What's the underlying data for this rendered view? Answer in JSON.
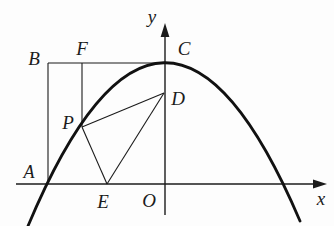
{
  "figure": {
    "background_color": "#fdfdfd",
    "ink_color": "#1b1b1b",
    "labels": {
      "y_axis": "y",
      "x_axis": "x",
      "origin": "O",
      "point_a": "A",
      "point_b": "B",
      "point_c": "C",
      "point_d": "D",
      "point_e": "E",
      "point_f": "F",
      "point_p": "P"
    },
    "geometry": {
      "parabola": {
        "opens": "down",
        "vertex_label": "C",
        "left_x_intercept_label": "A",
        "passes_through": [
          "A",
          "P",
          "C"
        ]
      },
      "segments": [
        "B to C (horizontal tangent line through F)",
        "B to A (vertical)",
        "F to P (vertical)",
        "P to D",
        "P to E",
        "E to D"
      ],
      "axes": [
        "x-axis with right arrow",
        "y-axis with up arrow",
        "origin O"
      ]
    }
  }
}
